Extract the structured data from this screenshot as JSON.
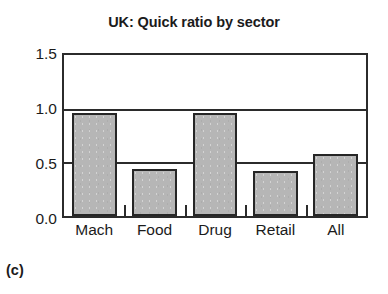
{
  "figure": {
    "caption": "(c)"
  },
  "chart_data": {
    "type": "bar",
    "title": "UK: Quick ratio by sector",
    "xlabel": "",
    "ylabel": "",
    "categories": [
      "Mach",
      "Food",
      "Drug",
      "Retail",
      "All"
    ],
    "values": [
      0.96,
      0.44,
      0.96,
      0.42,
      0.58
    ],
    "series": [
      {
        "name": "Quick ratio",
        "values": [
          0.96,
          0.44,
          0.96,
          0.42,
          0.58
        ]
      }
    ],
    "ylim": [
      0.0,
      1.5
    ],
    "yticks": [
      0.0,
      0.5,
      1.0,
      1.5
    ],
    "ytick_labels": [
      "0.0",
      "0.5",
      "1.0",
      "1.5"
    ],
    "gridlines": [
      0.5,
      1.0
    ],
    "grid": true,
    "legend": null,
    "legend_position": "none",
    "colors": {
      "bar_fill": "#b6b6b6",
      "bar_edge": "#262626",
      "axis": "#2b2b2b",
      "text": "#1b1b1b",
      "background": "#ffffff"
    }
  }
}
